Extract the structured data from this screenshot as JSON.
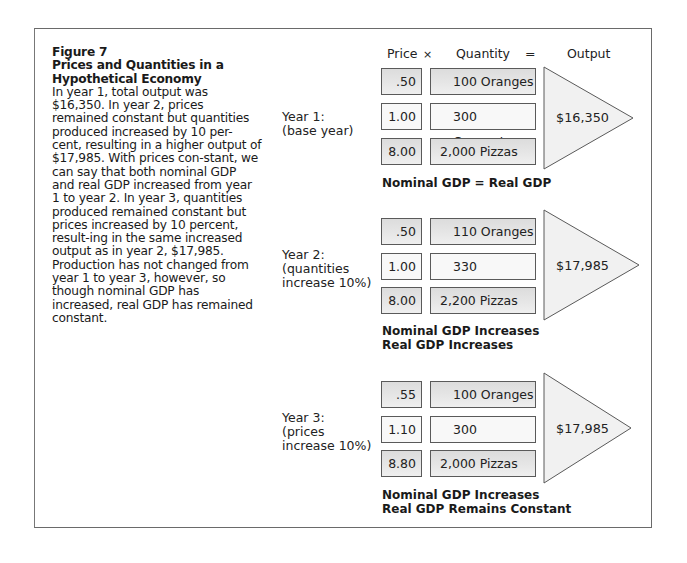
{
  "figure": {
    "number": "Figure 7",
    "title": "Prices and Quantities in a Hypothetical Economy",
    "body": "In year 1, total output was $16,350. In year 2, prices remained constant but quantities produced increased by 10 per-cent, resulting in a higher output of $17,985. With prices con-stant, we can say that both nominal GDP and real GDP increased from year 1 to year 2. In year 3, quantities produced remained constant but prices increased by 10 percent, result-ing in the same increased output as in year 2, $17,985. Production has not changed from year 1 to year 3, however, so though nominal GDP has increased, real GDP has remained constant."
  },
  "header": {
    "price": "Price",
    "times": "×",
    "quantity": "Quantity",
    "equals": "=",
    "output": "Output"
  },
  "years": [
    {
      "label_line1": "Year 1:",
      "label_line2": "(base year)",
      "label_line3": "",
      "rows": [
        {
          "price": ".50",
          "quantity": "100 Oranges"
        },
        {
          "price": "1.00",
          "quantity": "300 Coconuts"
        },
        {
          "price": "8.00",
          "quantity": "2,000 Pizzas"
        }
      ],
      "output": "$16,350",
      "note_line1": "Nominal GDP = Real GDP",
      "note_line2": ""
    },
    {
      "label_line1": "Year 2:",
      "label_line2": "(quantities",
      "label_line3": "increase 10%)",
      "rows": [
        {
          "price": ".50",
          "quantity": "110 Oranges"
        },
        {
          "price": "1.00",
          "quantity": "330 Coconuts"
        },
        {
          "price": "8.00",
          "quantity": "2,200 Pizzas"
        }
      ],
      "output": "$17,985",
      "note_line1": "Nominal GDP Increases",
      "note_line2": "Real GDP Increases"
    },
    {
      "label_line1": "Year 3:",
      "label_line2": "(prices",
      "label_line3": "increase 10%)",
      "rows": [
        {
          "price": ".55",
          "quantity": "100 Oranges"
        },
        {
          "price": "1.10",
          "quantity": "300 Coconuts"
        },
        {
          "price": "8.80",
          "quantity": "2,000 Pizzas"
        }
      ],
      "output": "$17,985",
      "note_line1": "Nominal GDP Increases",
      "note_line2": "Real GDP Remains Constant"
    }
  ],
  "colors": {
    "border": "#5a5a5a",
    "shaded_box": "#e2e2e2",
    "plain_box": "#f8f8f8",
    "triangle_fill": "#f1f1f1"
  }
}
